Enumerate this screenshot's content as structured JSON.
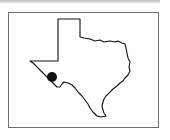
{
  "map": {
    "region": "Texas",
    "type": "locator-map",
    "marker": {
      "label": "location-marker",
      "cx": 52,
      "cy": 77,
      "r": 5,
      "color": "#111111"
    },
    "colors": {
      "outline": "#111111",
      "fill": "#ffffff",
      "frame": "#6e6e6e"
    }
  }
}
